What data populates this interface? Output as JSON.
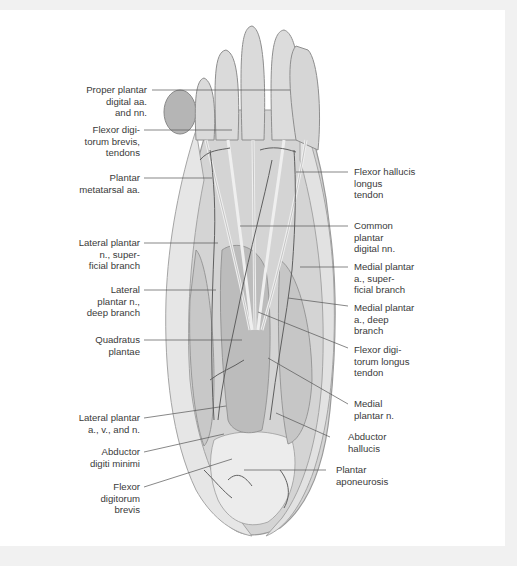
{
  "figure": {
    "colors": {
      "background_band": "#f1f1f1",
      "panel": "#ffffff",
      "label_text": "#3a3a3a",
      "leader_line": "#555555",
      "skin": "#d9d9d9",
      "muscle": "#bdbdbd",
      "vessel": "#6e6e6e"
    }
  },
  "labels": {
    "left": [
      {
        "id": "proper-plantar-digital",
        "text": "Proper plantar\ndigital aa.\nand nn."
      },
      {
        "id": "flexor-digitorum-brevis-tendons",
        "text": "Flexor digi-\ntorum brevis,\ntendons"
      },
      {
        "id": "plantar-metatarsal",
        "text": "Plantar\nmetatarsal aa."
      },
      {
        "id": "lateral-plantar-superficial",
        "text": "Lateral plantar\nn., super-\nficial branch"
      },
      {
        "id": "lateral-plantar-deep",
        "text": "Lateral\nplantar n.,\ndeep branch"
      },
      {
        "id": "quadratus-plantae",
        "text": "Quadratus\nplantae"
      },
      {
        "id": "lateral-plantar-avn",
        "text": "Lateral plantar\na., v., and n."
      },
      {
        "id": "abductor-digiti-minimi",
        "text": "Abductor\ndigiti minimi"
      },
      {
        "id": "flexor-digitorum-brevis",
        "text": "Flexor\ndigitorum\nbrevis"
      }
    ],
    "right": [
      {
        "id": "flexor-hallucis-longus",
        "text": "Flexor hallucis\nlongus\ntendon"
      },
      {
        "id": "common-plantar-digital",
        "text": "Common\nplantar\ndigital nn."
      },
      {
        "id": "medial-plantar-superficial",
        "text": "Medial plantar\na., super-\nficial branch"
      },
      {
        "id": "medial-plantar-deep",
        "text": "Medial plantar\na., deep\nbranch"
      },
      {
        "id": "flexor-digitorum-longus",
        "text": "Flexor digi-\ntorum longus\ntendon"
      },
      {
        "id": "medial-plantar-n",
        "text": "Medial\nplantar n."
      },
      {
        "id": "abductor-hallucis",
        "text": "Abductor\nhallucis"
      },
      {
        "id": "plantar-aponeurosis",
        "text": "Plantar\naponeurosis"
      }
    ]
  }
}
